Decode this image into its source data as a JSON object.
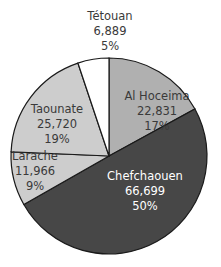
{
  "chart_data": {
    "type": "pie",
    "title": "",
    "slices": [
      {
        "label": "Al Hoceima",
        "value": 22831,
        "value_text": "22,831",
        "percent_text": "17%",
        "color": "#b0b0b0",
        "text_color": "#3a3a3a"
      },
      {
        "label": "Chefchaouen",
        "value": 66699,
        "value_text": "66,699",
        "percent_text": "50%",
        "color": "#474747",
        "text_color": "#ffffff"
      },
      {
        "label": "Larache",
        "value": 11966,
        "value_text": "11,966",
        "percent_text": "9%",
        "color": "#cdcdcd",
        "text_color": "#3a3a3a"
      },
      {
        "label": "Taounate",
        "value": 25720,
        "value_text": "25,720",
        "percent_text": "19%",
        "color": "#cdcdcd",
        "text_color": "#3a3a3a"
      },
      {
        "label": "Tétouan",
        "value": 6889,
        "value_text": "6,889",
        "percent_text": "5%",
        "color": "#ffffff",
        "text_color": "#3a3a3a"
      }
    ],
    "start_angle_deg": 0,
    "direction": "clockwise",
    "legend": "none"
  }
}
